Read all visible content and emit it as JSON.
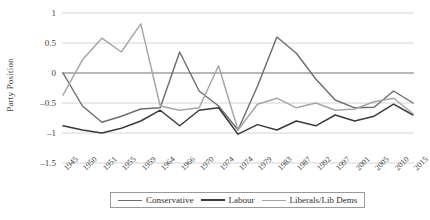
{
  "chart_data": {
    "type": "line",
    "title": "",
    "xlabel": "",
    "ylabel": "Party Position",
    "ylim": [
      -1.5,
      1
    ],
    "yticks": [
      "1",
      "0.5",
      "0",
      "-0.5",
      "-1",
      "-1.5"
    ],
    "ytick_values": [
      1,
      0.5,
      0,
      -0.5,
      -1,
      -1.5
    ],
    "grid": "horizontal",
    "legend_position": "bottom",
    "categories": [
      "1945",
      "1950",
      "1951",
      "1955",
      "1959",
      "1964",
      "1966",
      "1970",
      "1974",
      "1974",
      "1979",
      "1983",
      "1987",
      "1992",
      "1997",
      "2001",
      "2005",
      "2010",
      "2015"
    ],
    "series": [
      {
        "name": "Conservative",
        "color": "#6e6e6e",
        "values": [
          0.0,
          -0.55,
          -0.82,
          -0.72,
          -0.6,
          -0.58,
          0.35,
          -0.3,
          -0.55,
          -0.95,
          -0.22,
          0.6,
          0.33,
          -0.1,
          -0.45,
          -0.58,
          -0.57,
          -0.3,
          -0.5
        ]
      },
      {
        "name": "Labour",
        "color": "#3a3a3a",
        "values": [
          -0.88,
          -0.95,
          -1.0,
          -0.92,
          -0.8,
          -0.62,
          -0.88,
          -0.62,
          -0.58,
          -1.02,
          -0.86,
          -0.95,
          -0.8,
          -0.88,
          -0.7,
          -0.8,
          -0.72,
          -0.52,
          -0.7
        ]
      },
      {
        "name": "Liberals/Lib Dems",
        "color": "#a6a6a6",
        "values": [
          -0.37,
          0.22,
          0.58,
          0.35,
          0.82,
          -0.55,
          -0.62,
          -0.58,
          0.12,
          -0.95,
          -0.52,
          -0.42,
          -0.58,
          -0.5,
          -0.62,
          -0.6,
          -0.48,
          -0.42,
          -0.68
        ]
      }
    ]
  },
  "legend": {
    "items": [
      {
        "label": "Conservative"
      },
      {
        "label": "Labour"
      },
      {
        "label": "Liberals/Lib Dems"
      }
    ]
  }
}
